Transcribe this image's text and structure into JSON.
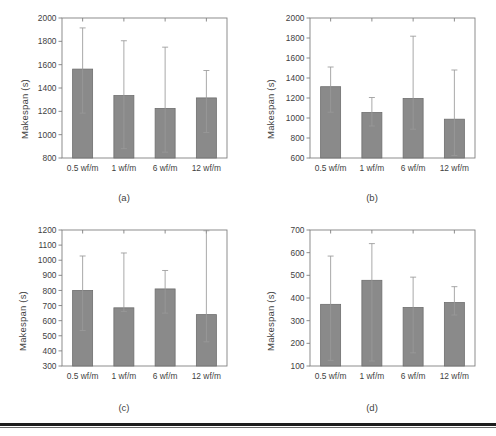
{
  "figure": {
    "background": "#ffffff",
    "bar_color": "#8a8a8a",
    "bar_edge_color": "#6e6e6e",
    "error_bar_color": "#9a9a9a",
    "axis_color": "#808080",
    "text_color": "#3f3f3f",
    "rule_color": "#1d1d1d"
  },
  "panels": [
    {
      "id": "a",
      "caption": "(a)",
      "ylabel": "Makespan (s)",
      "xlabel": "",
      "chart_data": {
        "type": "bar",
        "title": "",
        "xlabel": "",
        "ylabel": "Makespan (s)",
        "ylim": [
          800,
          2000
        ],
        "yticks": [
          800,
          1000,
          1200,
          1400,
          1600,
          1800,
          2000
        ],
        "ytick_labels": [
          "800",
          "1000",
          "1200",
          "1400",
          "1600",
          "1800",
          "2000"
        ],
        "grid": false,
        "legend": "none",
        "categories": [
          "0.5 wf/m",
          "1 wf/m",
          "6 wf/m",
          "12 wf/m"
        ],
        "values": [
          1562,
          1335,
          1225,
          1315
        ],
        "error_upper": [
          1915,
          1805,
          1750,
          1550
        ],
        "error_lower": [
          1185,
          880,
          850,
          1018
        ]
      }
    },
    {
      "id": "b",
      "caption": "(b)",
      "ylabel": "Makespan (s)",
      "xlabel": "",
      "chart_data": {
        "type": "bar",
        "title": "",
        "xlabel": "",
        "ylabel": "Makespan (s)",
        "ylim": [
          600,
          2000
        ],
        "yticks": [
          600,
          800,
          1000,
          1200,
          1400,
          1600,
          1800,
          2000
        ],
        "ytick_labels": [
          "600",
          "800",
          "1000",
          "1200",
          "1400",
          "1600",
          "1800",
          "2000"
        ],
        "grid": false,
        "legend": "none",
        "categories": [
          "0.5 wf/m",
          "1 wf/m",
          "6 wf/m",
          "12 wf/m"
        ],
        "values": [
          1313,
          1055,
          1195,
          988
        ],
        "error_upper": [
          1510,
          1205,
          1818,
          1480
        ],
        "error_lower": [
          1058,
          920,
          888,
          625
        ]
      }
    },
    {
      "id": "c",
      "caption": "(c)",
      "ylabel": "Makespan (s)",
      "xlabel": "",
      "chart_data": {
        "type": "bar",
        "title": "",
        "xlabel": "",
        "ylabel": "Makespan (s)",
        "ylim": [
          300,
          1200
        ],
        "yticks": [
          300,
          400,
          500,
          600,
          700,
          800,
          900,
          1000,
          1100,
          1200
        ],
        "ytick_labels": [
          "300",
          "400",
          "500",
          "600",
          "700",
          "800",
          "900",
          "1000",
          "1100",
          "1200"
        ],
        "grid": false,
        "legend": "none",
        "categories": [
          "0.5 wf/m",
          "1 wf/m",
          "6 wf/m",
          "12 wf/m"
        ],
        "values": [
          800,
          685,
          810,
          640
        ],
        "error_upper": [
          1028,
          1048,
          932,
          1195
        ],
        "error_lower": [
          535,
          660,
          650,
          460
        ]
      }
    },
    {
      "id": "d",
      "caption": "(d)",
      "ylabel": "Makespan (s)",
      "xlabel": "",
      "chart_data": {
        "type": "bar",
        "title": "",
        "xlabel": "",
        "ylabel": "Makespan (s)",
        "ylim": [
          100,
          700
        ],
        "yticks": [
          100,
          200,
          300,
          400,
          500,
          600,
          700
        ],
        "ytick_labels": [
          "100",
          "200",
          "300",
          "400",
          "500",
          "600",
          "700"
        ],
        "grid": false,
        "legend": "none",
        "categories": [
          "0.5 wf/m",
          "1 wf/m",
          "6 wf/m",
          "12 wf/m"
        ],
        "values": [
          372,
          478,
          358,
          380
        ],
        "error_upper": [
          585,
          640,
          492,
          450
        ],
        "error_lower": [
          125,
          122,
          158,
          325
        ]
      }
    }
  ]
}
